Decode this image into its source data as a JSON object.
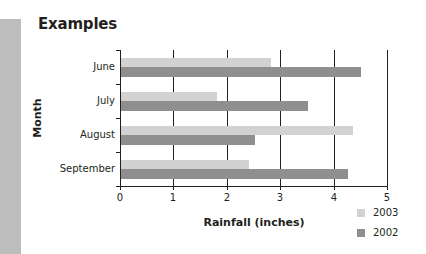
{
  "page": {
    "title": "Examples"
  },
  "chart_data": {
    "type": "bar",
    "orientation": "horizontal",
    "title": "Examples",
    "xlabel": "Rainfall (inches)",
    "ylabel": "Month",
    "categories": [
      "June",
      "July",
      "August",
      "September"
    ],
    "series": [
      {
        "name": "2003",
        "color": "#d2d2d2",
        "values": [
          2.8,
          1.8,
          4.35,
          2.4
        ]
      },
      {
        "name": "2002",
        "color": "#8f8f8f",
        "values": [
          4.5,
          3.5,
          2.5,
          4.25
        ]
      }
    ],
    "xlim": [
      0,
      5
    ],
    "xticks": [
      "0",
      "1",
      "2",
      "3",
      "4",
      "5"
    ],
    "grid": "vertical",
    "legend": {
      "position": "bottom-right",
      "entries": [
        "2003",
        "2002"
      ]
    }
  },
  "colors": {
    "side_strip": "#bdbdbd",
    "axis": "#231f20"
  }
}
